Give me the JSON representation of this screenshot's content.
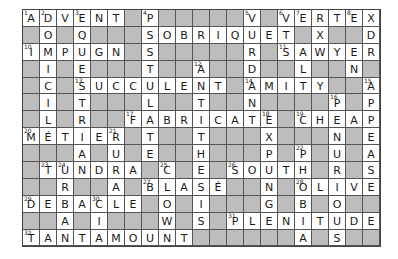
{
  "puzzle": {
    "cols": 21,
    "rows": 14,
    "colors": {
      "black_cell": "#bdbdbd",
      "white_cell": "#ffffff",
      "grid_line": "#555555",
      "text": "#1a1a1a"
    },
    "grid": [
      "ADVENT#P#####V#VERTEX",
      "#O#Q###SOBRIQUET#X##D#",
      "IMPUGN#S#####R#SAWYER",
      "#I#E###T##A##D##L##N#",
      "#C#SUCCULENT#AMITY##A",
      "#I#T###L##T##N####P#P",
      "#L#R##FABRICATE#CHEAP",
      "MÉTIER#T##T###X###N#E",
      "###A#U#E##H###P#P#U#A",
      "#TUNDRA#C#E#SOUTH#R#S",
      "##R##A#BLASÉ##N#OLIVE",
      "DEBACLE#O#I###G#B#O##",
      "##A#I###W#S#PLENITUDE",
      "TANTAMOUNT######A#S##"
    ],
    "numbers": [
      {
        "n": "1",
        "r": 0,
        "c": 0
      },
      {
        "n": "2",
        "r": 0,
        "c": 1
      },
      {
        "n": "3",
        "r": 0,
        "c": 3
      },
      {
        "n": "4",
        "r": 0,
        "c": 7
      },
      {
        "n": "5",
        "r": 0,
        "c": 13
      },
      {
        "n": "6",
        "r": 0,
        "c": 15
      },
      {
        "n": "7",
        "r": 0,
        "c": 16
      },
      {
        "n": "8",
        "r": 0,
        "c": 19
      },
      {
        "n": "9",
        "r": 1,
        "c": 6
      },
      {
        "n": "10",
        "r": 2,
        "c": 0
      },
      {
        "n": "11",
        "r": 2,
        "c": 15
      },
      {
        "n": "12",
        "r": 3,
        "c": 10
      },
      {
        "n": "13",
        "r": 4,
        "c": 3
      },
      {
        "n": "14",
        "r": 4,
        "c": 13
      },
      {
        "n": "15",
        "r": 4,
        "c": 20
      },
      {
        "n": "16",
        "r": 5,
        "c": 18
      },
      {
        "n": "17",
        "r": 6,
        "c": 6
      },
      {
        "n": "18",
        "r": 6,
        "c": 14
      },
      {
        "n": "19",
        "r": 6,
        "c": 16
      },
      {
        "n": "20",
        "r": 7,
        "c": 0
      },
      {
        "n": "21",
        "r": 7,
        "c": 5
      },
      {
        "n": "22",
        "r": 8,
        "c": 16
      },
      {
        "n": "23",
        "r": 9,
        "c": 1
      },
      {
        "n": "24",
        "r": 9,
        "c": 2
      },
      {
        "n": "25",
        "r": 9,
        "c": 8
      },
      {
        "n": "26",
        "r": 9,
        "c": 12
      },
      {
        "n": "27",
        "r": 10,
        "c": 7
      },
      {
        "n": "28",
        "r": 10,
        "c": 16
      },
      {
        "n": "29",
        "r": 11,
        "c": 0
      },
      {
        "n": "30",
        "r": 11,
        "c": 4
      },
      {
        "n": "31",
        "r": 12,
        "c": 12
      },
      {
        "n": "32",
        "r": 13,
        "c": 0
      }
    ]
  }
}
